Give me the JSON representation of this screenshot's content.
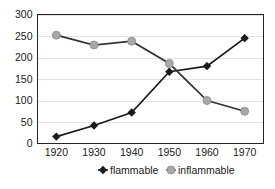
{
  "chart_data": {
    "type": "line",
    "title": "",
    "subtitle": "",
    "xlabel": "",
    "ylabel": "",
    "x": [
      1920,
      1930,
      1940,
      1950,
      1960,
      1970
    ],
    "categories": [
      "1920",
      "1930",
      "1940",
      "1950",
      "1960",
      "1970"
    ],
    "xlim": [
      1915,
      1975
    ],
    "ylim": [
      0,
      300
    ],
    "y_ticks": [
      0,
      50,
      100,
      150,
      200,
      250,
      300
    ],
    "y_tick_labels": [
      "0",
      "50",
      "100",
      "150",
      "200",
      "250",
      "300"
    ],
    "x_tick_labels": [
      "1920",
      "1930",
      "1940",
      "1950",
      "1960",
      "1970"
    ],
    "grid": "horizontal",
    "legend_position": "bottom",
    "series": [
      {
        "name": "flammable",
        "values": [
          16,
          42,
          72,
          167,
          180,
          245
        ],
        "color": "#1a1a1a",
        "marker": "diamond",
        "marker_color": "#1a1a1a"
      },
      {
        "name": "inflammable",
        "values": [
          252,
          229,
          238,
          186,
          100,
          75
        ],
        "color": "#333333",
        "marker": "circle",
        "marker_color": "#a8a8a8"
      }
    ]
  },
  "legend": {
    "items": [
      {
        "label": "flammable",
        "marker": "diamond",
        "color": "#1a1a1a"
      },
      {
        "label": "inflammable",
        "marker": "circle",
        "color": "#a8a8a8"
      }
    ]
  },
  "colors": {
    "background": "#ffffff",
    "frame": "#262626",
    "grid": "#e2e2e2",
    "text": "#1a1a1a",
    "flammable": "#1a1a1a",
    "inflammable": "#a8a8a8"
  }
}
